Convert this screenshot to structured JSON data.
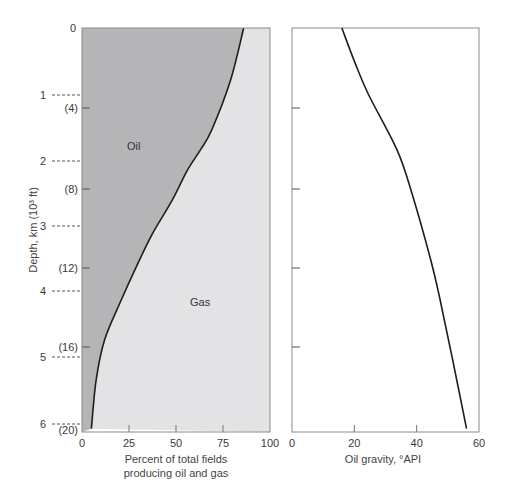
{
  "chart_data": [
    {
      "type": "area",
      "panel": "left",
      "xlabel_line1": "Percent of total fields",
      "xlabel_line2": "producing oil and gas",
      "ylabel": "Depth, km (10³ ft)",
      "xlim": [
        0,
        100
      ],
      "ylim_km": [
        0,
        6
      ],
      "x_ticks": [
        "0",
        "25",
        "50",
        "75",
        "100"
      ],
      "y_ticks_km": [
        "0",
        "1",
        "2",
        "3",
        "4",
        "5",
        "6"
      ],
      "y_ticks_ft": [
        "(4)",
        "(8)",
        "(12)",
        "(16)",
        "(20)"
      ],
      "regions": [
        {
          "name": "Oil",
          "color": "#b5b5b7"
        },
        {
          "name": "Gas",
          "color": "#e3e3e5"
        }
      ],
      "boundary_curve": {
        "depth_km": [
          0,
          0.79,
          1.54,
          1.84,
          2.15,
          2.6,
          3.13,
          3.66,
          4.1,
          4.71,
          5.32,
          6.05
        ],
        "percent_oil": [
          86,
          79,
          69,
          63,
          56,
          48,
          37,
          28,
          21,
          12,
          7.5,
          5
        ]
      }
    },
    {
      "type": "line",
      "panel": "right",
      "xlabel": "Oil gravity, °API",
      "xlim": [
        0,
        60
      ],
      "ylim_km": [
        0,
        6
      ],
      "x_ticks": [
        "0",
        "20",
        "40",
        "60"
      ],
      "series": [
        {
          "name": "Oil gravity",
          "depth_km": [
            0,
            0.5,
            1,
            1.84,
            2.5,
            3.5,
            4.1,
            5,
            6.05
          ],
          "api": [
            16,
            20,
            24.5,
            33.7,
            38.5,
            44.5,
            47.5,
            51.5,
            56
          ]
        }
      ]
    }
  ],
  "labels": {
    "oil": "Oil",
    "gas": "Gas",
    "ylabel": "Depth, km (10³ ft)",
    "left_xlabel_1": "Percent of total fields",
    "left_xlabel_2": "producing oil and gas",
    "right_xlabel": "Oil gravity, °API"
  }
}
